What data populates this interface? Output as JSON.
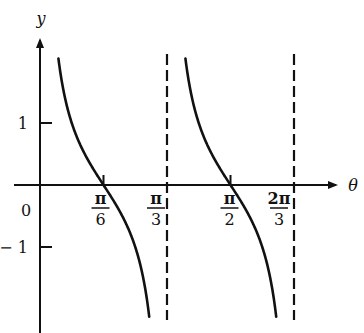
{
  "chart_data": {
    "type": "line",
    "title": "",
    "function": "y = cot(3θ)",
    "xlabel": "θ",
    "ylabel": "y",
    "x_ticks": [
      {
        "value": 0.5236,
        "num": "π",
        "den": "6"
      },
      {
        "value": 1.0472,
        "num": "π",
        "den": "3"
      },
      {
        "value": 1.5708,
        "num": "π",
        "den": "2"
      },
      {
        "value": 2.0944,
        "num": "2π",
        "den": "3"
      }
    ],
    "y_ticks": [
      {
        "value": 1,
        "label": "1"
      },
      {
        "value": -1,
        "label": "− 1"
      }
    ],
    "origin_label": "0",
    "asymptotes": [
      1.0472,
      2.0944
    ],
    "zeros": [
      0.5236,
      1.5708
    ],
    "xlim": [
      0,
      2.45
    ],
    "ylim": [
      -2.4,
      2.4
    ],
    "visible_y_range": [
      -2.15,
      2.06
    ],
    "grid": false,
    "legend": null,
    "series": [
      {
        "name": "branch 1",
        "domain": [
          0,
          1.0472
        ]
      },
      {
        "name": "branch 2",
        "domain": [
          1.0472,
          2.0944
        ]
      }
    ]
  },
  "colors": {
    "curve": "#111111",
    "axis": "#111111",
    "asymptote": "#111111",
    "background": "#ffffff"
  }
}
